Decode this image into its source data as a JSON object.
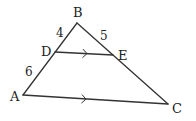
{
  "diagram": {
    "type": "triangle-parallel-line",
    "stroke_color": "#333333",
    "points": {
      "A": {
        "x": 23,
        "y": 95,
        "label": "A",
        "lx": 10,
        "ly": 101
      },
      "B": {
        "x": 77,
        "y": 23,
        "label": "B",
        "lx": 73,
        "ly": 17
      },
      "C": {
        "x": 168,
        "y": 104,
        "label": "C",
        "lx": 172,
        "ly": 113
      },
      "D": {
        "x": 55,
        "y": 52,
        "label": "D",
        "lx": 41,
        "ly": 56
      },
      "E": {
        "x": 113,
        "y": 55,
        "label": "E",
        "lx": 118,
        "ly": 60
      }
    },
    "segments": [
      {
        "from": "A",
        "to": "B"
      },
      {
        "from": "B",
        "to": "C"
      },
      {
        "from": "A",
        "to": "C",
        "parallel_mark": true
      },
      {
        "from": "D",
        "to": "E",
        "parallel_mark": true
      }
    ],
    "lengths": [
      {
        "segment": "BD",
        "value": "4",
        "x": 56,
        "y": 37
      },
      {
        "segment": "BE",
        "value": "5",
        "x": 100,
        "y": 40
      },
      {
        "segment": "AD",
        "value": "6",
        "x": 25,
        "y": 76
      }
    ],
    "parallel_marks": [
      {
        "segment": "DE",
        "x": 85,
        "y": 53.5
      },
      {
        "segment": "AC",
        "x": 84,
        "y": 99
      }
    ]
  }
}
